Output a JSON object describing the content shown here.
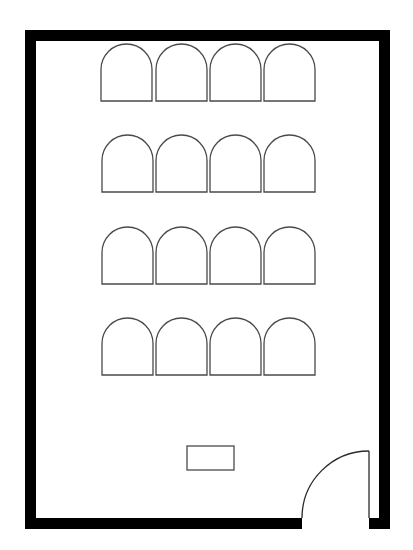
{
  "diagram": {
    "type": "floor-plan",
    "colors": {
      "wall": "#000000",
      "line": "#4a4a4a",
      "background": "#ffffff"
    },
    "walls": {
      "outer": {
        "x": 25,
        "y": 30,
        "width": 365,
        "height": 499
      },
      "thickness": 11
    },
    "chair_rows": [
      {
        "row": 1,
        "y": 44,
        "xs": [
          101,
          156,
          210,
          264
        ]
      },
      {
        "row": 2,
        "y": 135,
        "xs": [
          102,
          156,
          210,
          264
        ]
      },
      {
        "row": 3,
        "y": 227,
        "xs": [
          102,
          156,
          210,
          264
        ]
      },
      {
        "row": 4,
        "y": 318,
        "xs": [
          102,
          156,
          210,
          264
        ]
      }
    ],
    "chair": {
      "width": 51,
      "height": 57
    },
    "table": {
      "x": 187,
      "y": 446,
      "width": 47,
      "height": 24
    },
    "door": {
      "opening_start_x": 302,
      "opening_end_x": 369,
      "swing_top_y": 451
    }
  }
}
